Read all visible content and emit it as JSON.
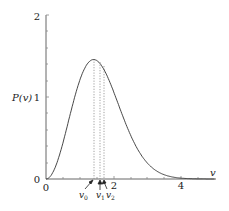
{
  "chart_data": {
    "type": "line",
    "title": "",
    "xlabel": "v",
    "ylabel": "P(v)",
    "xlim": [
      0,
      5
    ],
    "ylim": [
      0,
      2
    ],
    "x_ticks": [
      "0",
      "2",
      "4"
    ],
    "y_ticks": [
      "0",
      "1",
      "2"
    ],
    "grid": false,
    "series": [
      {
        "name": "P(v)",
        "function": "P(v) = A v^2 exp(-v^2/2), A ≈ 1.98",
        "x": [
          0,
          0.5,
          1.0,
          1.41,
          2.0,
          2.5,
          3.0,
          3.5,
          4.0,
          4.5,
          5.0
        ],
        "values": [
          0,
          0.44,
          1.2,
          1.46,
          1.07,
          0.54,
          0.2,
          0.05,
          0.01,
          0.0,
          0.0
        ]
      }
    ],
    "annotations": [
      {
        "label": "v_0",
        "x": 1.41,
        "style": "dotted vertical + arrow"
      },
      {
        "label": "v_1",
        "x": 1.6,
        "style": "dotted vertical + arrow"
      },
      {
        "label": "v_2",
        "x": 1.73,
        "style": "dotted vertical + arrow"
      }
    ]
  },
  "labels": {
    "y_axis": "P(v)",
    "x_axis": "v",
    "y_tick_0": "0",
    "y_tick_1": "1",
    "y_tick_2": "2",
    "x_tick_0": "0",
    "x_tick_2": "2",
    "x_tick_4": "4",
    "v0": "v",
    "v0_sub": "0",
    "v1": "v",
    "v1_sub": "1",
    "v2": "v",
    "v2_sub": "2"
  },
  "colors": {
    "curve": "#333333",
    "axis": "#666666",
    "dotted": "#888888"
  }
}
